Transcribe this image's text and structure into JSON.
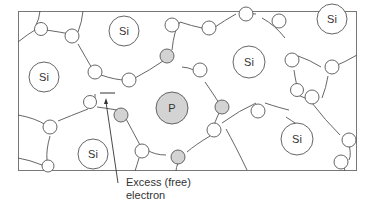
{
  "diagram": {
    "title": "",
    "colors": {
      "line": "#555555",
      "atom_fill": "#ffffff",
      "dopant_fill": "#d3d3d3",
      "text": "#333333"
    },
    "atoms": [
      {
        "label": "Si",
        "x": 124,
        "y": 31,
        "r": 15
      },
      {
        "label": "Si",
        "x": 44,
        "y": 77,
        "r": 15
      },
      {
        "label": "Si",
        "x": 249,
        "y": 62,
        "r": 16
      },
      {
        "label": "Si",
        "x": 332,
        "y": 19,
        "r": 15
      },
      {
        "label": "P",
        "x": 172,
        "y": 108,
        "r": 16,
        "dopant": true
      },
      {
        "label": "Si",
        "x": 297,
        "y": 139,
        "r": 16
      },
      {
        "label": "Si",
        "x": 93,
        "y": 154,
        "r": 15
      }
    ],
    "electron_label_line1": "Excess (free)",
    "electron_label_line2": "electron"
  }
}
